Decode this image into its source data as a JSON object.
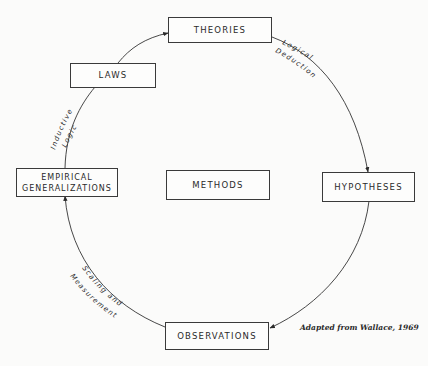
{
  "diagram": {
    "nodes": {
      "theories": "THEORIES",
      "laws": "LAWS",
      "empirical_generalizations_line1": "EMPIRICAL",
      "empirical_generalizations_line2": "GENERALIZATIONS",
      "methods": "METHODS",
      "hypotheses": "HYPOTHESES",
      "observations": "OBSERVATIONS"
    },
    "edge_labels": {
      "logical_line1": "Logical",
      "logical_line2": "Deduction",
      "inductive_line1": "Inductive",
      "inductive_line2": "Logic",
      "scaling_line1": "Scaling and",
      "scaling_line2": "Measurement"
    },
    "edges": [
      {
        "from": "THEORIES",
        "to": "HYPOTHESES",
        "label": "Logical Deduction"
      },
      {
        "from": "HYPOTHESES",
        "to": "OBSERVATIONS",
        "label": ""
      },
      {
        "from": "OBSERVATIONS",
        "to": "EMPIRICAL GENERALIZATIONS",
        "label": "Scaling and Measurement"
      },
      {
        "from": "EMPIRICAL GENERALIZATIONS",
        "to": "LAWS",
        "label": "Inductive Logic"
      },
      {
        "from": "LAWS",
        "to": "THEORIES",
        "label": ""
      }
    ],
    "caption": "Adapted from Wallace, 1969"
  }
}
